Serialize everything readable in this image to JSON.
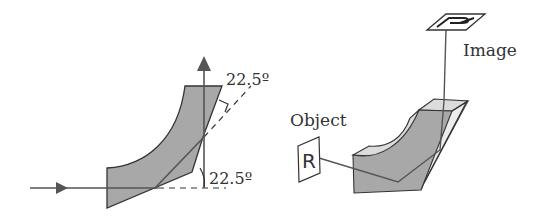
{
  "left_figure": {
    "angle_top_label": "22.5º",
    "angle_bottom_label": "22.5º"
  },
  "right_figure": {
    "object_label": "Object",
    "image_label": "Image",
    "object_glyph": "R",
    "image_glyph": "R"
  },
  "colors": {
    "prism_fill": "#a8a8a8",
    "prism_light": "#dcdcdc",
    "prism_lighter": "#ececec",
    "line": "#555555",
    "outline": "#333333"
  }
}
